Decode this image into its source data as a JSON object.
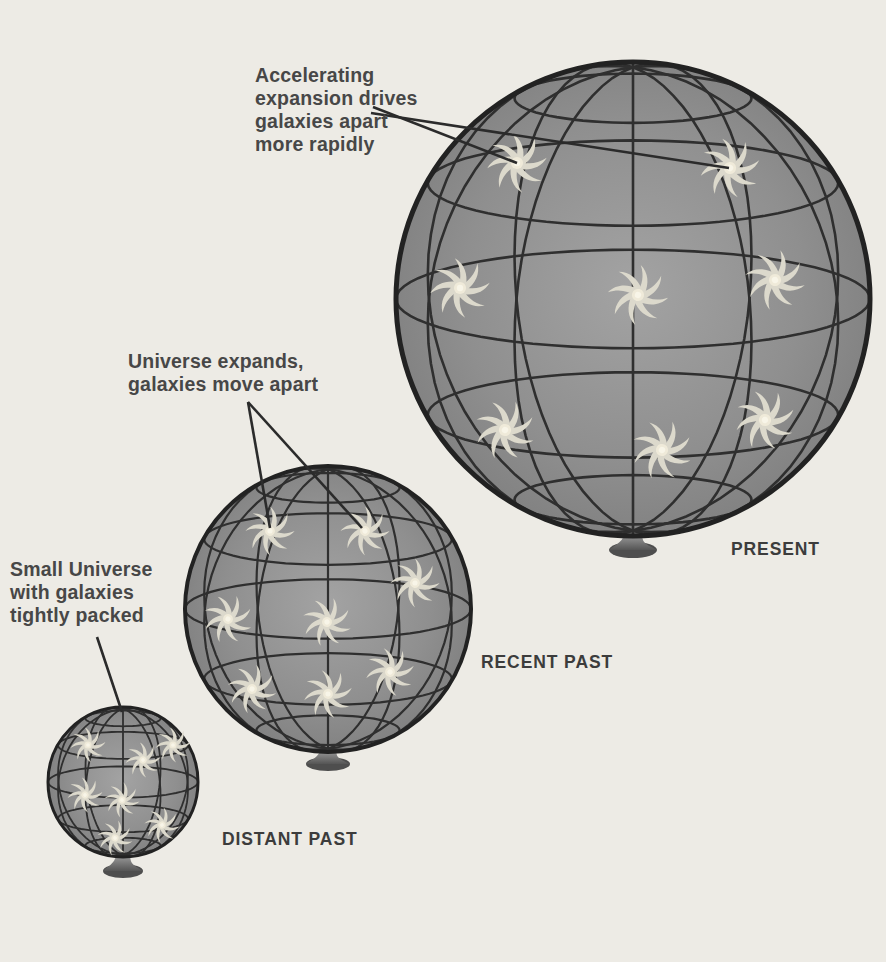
{
  "annotations": {
    "accelerating": {
      "text": "Accelerating\nexpansion drives\ngalaxies apart\nmore rapidly"
    },
    "expanding": {
      "text": "Universe expands,\ngalaxies move apart"
    },
    "small": {
      "text": "Small Universe\nwith galaxies\ntightly packed"
    }
  },
  "labels": {
    "present": "PRESENT",
    "recent_past": "RECENT PAST",
    "distant_past": "DISTANT PAST"
  },
  "colors": {
    "background": "#edebe5",
    "sphere_center": "#a3a3a3",
    "sphere_mid": "#8f8f8f",
    "sphere_edge": "#7d7d7d",
    "grid_line": "#2f2f2f",
    "outline": "#222222",
    "galaxy_arm": "#dcd9cc",
    "galaxy_core": "#efead9",
    "galaxy_core_highlight": "#f8f5e8",
    "pedestal_top": "#9e9e9e",
    "pedestal_bottom": "#555555",
    "pedestal_base": "#4e4e4e",
    "leader_line": "#2b2b2b",
    "annotation_text": "#474747",
    "label_text": "#3c3c3c"
  },
  "diagram": {
    "tilt_deg": 12,
    "grid": {
      "latitudes_deg": [
        -60,
        -30,
        0,
        30,
        60
      ],
      "meridians_deg": [
        -60,
        -30,
        0,
        30,
        60
      ]
    },
    "spheres": [
      {
        "id": "present",
        "cx": 633,
        "cy": 299,
        "r": 237,
        "outline_w": 5,
        "grid_w": 2.6,
        "galaxy_scale": 1.45,
        "galaxies": [
          [
            517,
            163,
            0
          ],
          [
            730,
            168,
            40
          ],
          [
            460,
            288,
            90
          ],
          [
            638,
            295,
            15
          ],
          [
            775,
            280,
            65
          ],
          [
            505,
            430,
            120
          ],
          [
            662,
            450,
            30
          ],
          [
            765,
            420,
            80
          ]
        ],
        "pedestal": {
          "neck": 9,
          "base_rx": 24,
          "base_ry": 8,
          "drop": 16
        }
      },
      {
        "id": "recent-past",
        "cx": 328,
        "cy": 609,
        "r": 143,
        "outline_w": 4,
        "grid_w": 2.2,
        "galaxy_scale": 1.18,
        "galaxies": [
          [
            270,
            531,
            10
          ],
          [
            365,
            531,
            55
          ],
          [
            415,
            583,
            100
          ],
          [
            228,
            619,
            30
          ],
          [
            327,
            622,
            70
          ],
          [
            390,
            672,
            130
          ],
          [
            252,
            689,
            20
          ],
          [
            328,
            694,
            85
          ]
        ],
        "pedestal": {
          "neck": 8,
          "base_rx": 22,
          "base_ry": 7,
          "drop": 14
        }
      },
      {
        "id": "distant-past",
        "cx": 123,
        "cy": 782,
        "r": 75,
        "outline_w": 3,
        "grid_w": 1.8,
        "galaxy_scale": 0.85,
        "galaxies": [
          [
            88,
            745,
            0
          ],
          [
            143,
            760,
            45
          ],
          [
            173,
            745,
            90
          ],
          [
            85,
            795,
            135
          ],
          [
            115,
            838,
            20
          ],
          [
            162,
            825,
            60
          ],
          [
            122,
            800,
            105
          ]
        ],
        "pedestal": {
          "neck": 7,
          "base_rx": 20,
          "base_ry": 7,
          "drop": 16
        }
      }
    ],
    "leader_lines": [
      {
        "from": [
          373,
          107
        ],
        "to": [
          517,
          163
        ]
      },
      {
        "from": [
          371,
          113
        ],
        "to": [
          729,
          168
        ]
      },
      {
        "from": [
          248,
          402
        ],
        "to": [
          270,
          528
        ]
      },
      {
        "from": [
          248,
          402
        ],
        "to": [
          362,
          528
        ]
      },
      {
        "from": [
          97,
          637
        ],
        "to": [
          122,
          712
        ]
      }
    ]
  }
}
